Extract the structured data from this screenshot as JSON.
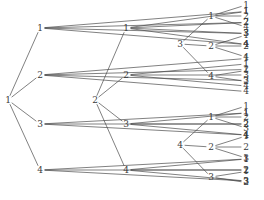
{
  "figure": {
    "title": "",
    "background_color": "#ffffff",
    "line_color": "#4a4a4a",
    "text_color": "#3a3a3a",
    "width": 264,
    "height": 200
  },
  "chart_data": {
    "type": "diagram",
    "diagram_kind": "rooted-tree-forest",
    "title": "",
    "xlabel": "",
    "ylabel": "",
    "trees": [
      {
        "root": "1",
        "root_pos": [
          8,
          100
        ],
        "branches": [
          {
            "label": "1",
            "pos": [
              40,
              28
            ],
            "leaves": [
              "1",
              "2",
              "3",
              "4"
            ]
          },
          {
            "label": "2",
            "pos": [
              40,
              75
            ],
            "leaves": [
              "1",
              "2",
              "3",
              "4"
            ]
          },
          {
            "label": "3",
            "pos": [
              40,
              124
            ],
            "leaves": [
              "1",
              "2",
              "4"
            ]
          },
          {
            "label": "4",
            "pos": [
              40,
              170
            ],
            "leaves": [
              "1",
              "2",
              "3"
            ]
          }
        ]
      },
      {
        "root": "2",
        "root_pos": [
          95,
          100
        ],
        "branches": [
          {
            "label": "1",
            "pos": [
              126,
              28
            ],
            "leaves": [
              "1",
              "2",
              "3",
              "4"
            ]
          },
          {
            "label": "2",
            "pos": [
              126,
              75
            ],
            "leaves": [
              "1",
              "3",
              "4"
            ]
          },
          {
            "label": "3",
            "pos": [
              126,
              124
            ],
            "leaves": [
              "1",
              "2",
              "4"
            ]
          },
          {
            "label": "4",
            "pos": [
              126,
              170
            ],
            "leaves": [
              "1",
              "2",
              "3"
            ]
          }
        ]
      },
      {
        "root": "3",
        "root_pos": [
          180,
          44
        ],
        "branches": [
          {
            "label": "1",
            "pos": [
              211,
              16
            ],
            "leaves": [
              "1",
              "2",
              "4"
            ]
          },
          {
            "label": "2",
            "pos": [
              211,
              46
            ],
            "leaves": [
              "1",
              "2",
              "4"
            ]
          },
          {
            "label": "4",
            "pos": [
              211,
              76
            ],
            "leaves": [
              "1",
              "2"
            ]
          }
        ]
      },
      {
        "root": "4",
        "root_pos": [
          180,
          145
        ],
        "branches": [
          {
            "label": "1",
            "pos": [
              211,
              117
            ],
            "leaves": [
              "1",
              "2",
              "3"
            ]
          },
          {
            "label": "2",
            "pos": [
              211,
              147
            ],
            "leaves": [
              "1",
              "2",
              "3"
            ]
          },
          {
            "label": "3",
            "pos": [
              211,
              177
            ],
            "leaves": [
              "1",
              "2"
            ]
          }
        ]
      }
    ],
    "leaf_column_x": 246,
    "leaf_spacing": 11
  }
}
